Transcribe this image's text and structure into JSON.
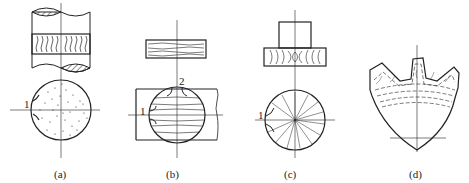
{
  "figure": {
    "panels": [
      {
        "id": "a",
        "caption": "(a)",
        "callouts": [
          "1"
        ],
        "description": "Bar stock with longitudinal fiber flow; cross-section with uniformly dispersed fibers"
      },
      {
        "id": "b",
        "caption": "(b)",
        "callouts": [
          "1",
          "2"
        ],
        "description": "Plate cut from bar; cross-section with parallel horizontal fiber flow"
      },
      {
        "id": "c",
        "caption": "(c)",
        "callouts": [
          "1"
        ],
        "description": "Upset forged blank; cross-section with radial fiber flow"
      },
      {
        "id": "d",
        "caption": "(d)",
        "callouts": [],
        "description": "Forged gear segment with fiber flow following tooth contour"
      }
    ]
  }
}
